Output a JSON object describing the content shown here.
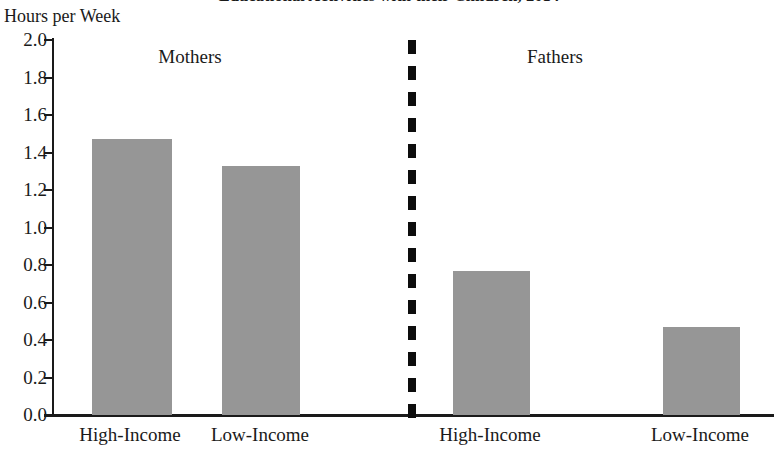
{
  "chart_data": {
    "type": "bar",
    "title": "Educational Activities with their Children, 2014",
    "title_note": "Title is clipped at the top edge of the screenshot",
    "ylabel": "Hours per Week",
    "xlabel": "",
    "ylim": [
      0.0,
      2.0
    ],
    "ytick_labels": [
      "2.0",
      "1.8",
      "1.6",
      "1.4",
      "1.2",
      "1.0",
      "0.8",
      "0.6",
      "0.4",
      "0.2",
      "0.0"
    ],
    "ytick_values": [
      2.0,
      1.8,
      1.6,
      1.4,
      1.2,
      1.0,
      0.8,
      0.6,
      0.4,
      0.2,
      0.0
    ],
    "grid": false,
    "legend": "none",
    "bar_color": "#969696",
    "axis_color": "#1a1a1a",
    "divider": {
      "label": "dashed-vertical-divider",
      "color": "#0d0d0d",
      "style": "dashed",
      "between": [
        "Mothers",
        "Fathers"
      ]
    },
    "group_labels": [
      "Mothers",
      "Fathers"
    ],
    "categories": [
      "High-Income",
      "Low-Income",
      "High-Income",
      "Low-Income"
    ],
    "values": [
      1.47,
      1.33,
      0.77,
      0.47
    ],
    "groups": [
      {
        "name": "Mothers",
        "categories": [
          "High-Income",
          "Low-Income"
        ],
        "values": [
          1.47,
          1.33
        ]
      },
      {
        "name": "Fathers",
        "categories": [
          "High-Income",
          "Low-Income"
        ],
        "values": [
          0.77,
          0.47
        ]
      }
    ]
  }
}
